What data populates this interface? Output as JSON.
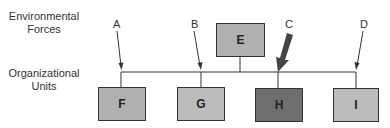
{
  "labels": {
    "environmental": "Environmental\nForces",
    "environmental_line1": "Environmental",
    "environmental_line2": "Forces",
    "organizational_line1": "Organizational",
    "organizational_line2": "Units"
  },
  "forces": [
    {
      "label": "A"
    },
    {
      "label": "B"
    },
    {
      "label": "C"
    },
    {
      "label": "D"
    }
  ],
  "top_unit": {
    "label": "E",
    "color": "#b0b0b0"
  },
  "units": [
    {
      "label": "F",
      "color": "#b0b0b0"
    },
    {
      "label": "G",
      "color": "#bcbcbc"
    },
    {
      "label": "H",
      "color": "#6e6e6e"
    },
    {
      "label": "I",
      "color": "#bcbcbc"
    }
  ]
}
